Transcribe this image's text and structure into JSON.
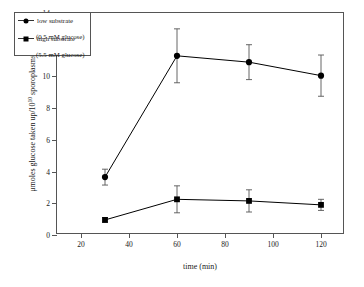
{
  "chart_data": {
    "type": "line",
    "title": "",
    "xlabel": "time (min)",
    "ylabel": "μmoles glucose taken up/10",
    "ylabel_superscript": "10",
    "ylabel_suffix": " sporoplasms",
    "x": [
      30,
      60,
      90,
      120
    ],
    "xlim": [
      10,
      130
    ],
    "ylim": [
      0,
      14
    ],
    "xticks": [
      20,
      40,
      60,
      80,
      100,
      120
    ],
    "yticks": [
      0,
      2,
      4,
      6,
      8,
      10,
      12,
      14
    ],
    "grid": false,
    "legend_position": "top-left",
    "series": [
      {
        "name": "low substrate",
        "sublabel": "(0.5 mM glucose)",
        "marker": "circle",
        "color": "#000000",
        "values": [
          3.65,
          11.3,
          10.9,
          10.05
        ],
        "errors": [
          0.5,
          1.7,
          1.1,
          1.3
        ]
      },
      {
        "name": "high substrate",
        "sublabel": "(5.5 mM glucose)",
        "marker": "square",
        "color": "#000000",
        "values": [
          0.95,
          2.25,
          2.15,
          1.9
        ],
        "errors": [
          0.15,
          0.85,
          0.7,
          0.35
        ]
      }
    ]
  }
}
